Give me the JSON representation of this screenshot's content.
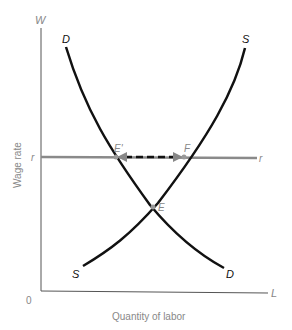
{
  "diagram": {
    "title": "",
    "y_axis": {
      "symbol": "W",
      "label": "Wage rate",
      "rate_label": "r"
    },
    "x_axis": {
      "symbol": "L",
      "label": "Quantity of labor",
      "origin": "0"
    },
    "curves": {
      "demand": {
        "top_label": "D",
        "bottom_label": "D"
      },
      "supply": {
        "top_label": "S",
        "bottom_label": "S"
      },
      "rate_line": {
        "left_label": "r",
        "right_label": "r"
      }
    },
    "points": {
      "e_prime": "E'",
      "f": "F",
      "e": "E"
    },
    "colors": {
      "curve": "#111111",
      "axis": "#555555",
      "rate_line": "#8a8a8a",
      "label_gray": "#888888"
    }
  }
}
